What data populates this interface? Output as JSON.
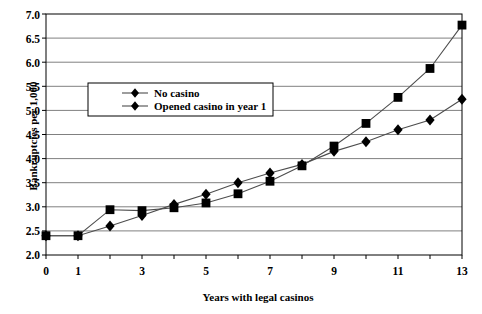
{
  "chart_data": {
    "type": "line",
    "title": "",
    "xlabel": "Years with legal casinos",
    "ylabel": "Bankruptcies per 1,000",
    "x": [
      0,
      1,
      2,
      3,
      4,
      5,
      6,
      7,
      8,
      9,
      10,
      11,
      12,
      13
    ],
    "xlim": [
      0,
      13
    ],
    "ylim": [
      2.0,
      7.0
    ],
    "xticks": [
      "0",
      "1",
      "2",
      "3",
      "4",
      "5",
      "6",
      "7",
      "8",
      "9",
      "10",
      "11",
      "12",
      "13"
    ],
    "xticklabels_shown": [
      "0",
      "1",
      "",
      "3",
      "",
      "5",
      "",
      "7",
      "",
      "9",
      "",
      "11",
      "",
      "13"
    ],
    "yticks": [
      "2.0",
      "2.5",
      "3.0",
      "3.5",
      "4.0",
      "4.5",
      "5.0",
      "5.5",
      "6.0",
      "6.5",
      "7.0"
    ],
    "grid": true,
    "grid_axis": "y",
    "legend_position": "upper-left-inside",
    "series": [
      {
        "name": "No casino",
        "marker": "diamond",
        "values": [
          2.4,
          2.4,
          2.6,
          2.82,
          3.05,
          3.26,
          3.5,
          3.7,
          3.88,
          4.15,
          4.35,
          4.6,
          4.8,
          5.23
        ]
      },
      {
        "name": "Opened casino in year 1",
        "marker": "square",
        "values": [
          2.4,
          2.4,
          2.94,
          2.92,
          2.98,
          3.08,
          3.27,
          3.53,
          3.85,
          4.26,
          4.73,
          5.27,
          5.87,
          6.77
        ]
      }
    ],
    "colors": {
      "series_line": "#4d4d4d",
      "marker_fill": "#000000",
      "gridline": "#808080",
      "axis": "#000000",
      "background": "#ffffff"
    }
  },
  "legend": {
    "items": [
      {
        "label": "No casino",
        "marker": "diamond-icon"
      },
      {
        "label": "Opened casino in year 1",
        "marker": "square-icon"
      }
    ]
  }
}
